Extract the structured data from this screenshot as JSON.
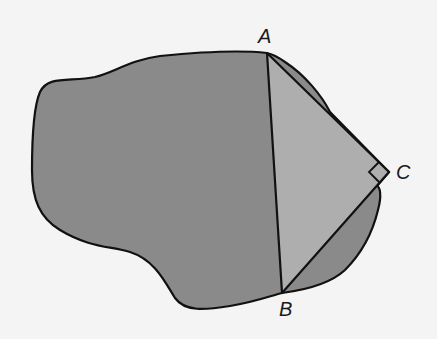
{
  "figure": {
    "colors": {
      "background": "#f4f4f4",
      "region": "#8a8a8a",
      "triangle": "#aeaeae",
      "outline": "#111111"
    },
    "points": {
      "A": {
        "label": "A",
        "x": 267,
        "y": 53
      },
      "B": {
        "label": "B",
        "x": 282,
        "y": 293
      },
      "C": {
        "label": "C",
        "x": 389,
        "y": 172
      }
    },
    "right_angle_vertex": "C"
  }
}
